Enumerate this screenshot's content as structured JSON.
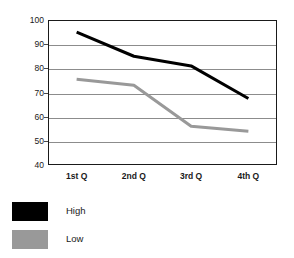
{
  "chart_data": {
    "type": "line",
    "title": "",
    "xlabel": "",
    "ylabel": "",
    "categories": [
      "1st Q",
      "2nd Q",
      "3rd Q",
      "4th Q"
    ],
    "series": [
      {
        "name": "High",
        "color": "#000000",
        "values": [
          95,
          85,
          81,
          67.5
        ]
      },
      {
        "name": "Low",
        "color": "#999999",
        "values": [
          75.5,
          73,
          56,
          54
        ]
      }
    ],
    "ylim": [
      40,
      100
    ],
    "yticks": [
      100,
      90,
      80,
      70,
      60,
      50,
      40
    ],
    "ytick_labels": [
      "100",
      "90",
      "80",
      "70",
      "60",
      "50",
      "40"
    ],
    "grid": true,
    "legend_position": "bottom-left"
  },
  "legend": {
    "items": [
      {
        "label": "High",
        "color": "#000000"
      },
      {
        "label": "Low",
        "color": "#999999"
      }
    ]
  },
  "colors": {
    "axis": "#1a1a1a",
    "grid": "#8c8c8c",
    "high": "#000000",
    "low": "#999999",
    "background": "#ffffff"
  }
}
